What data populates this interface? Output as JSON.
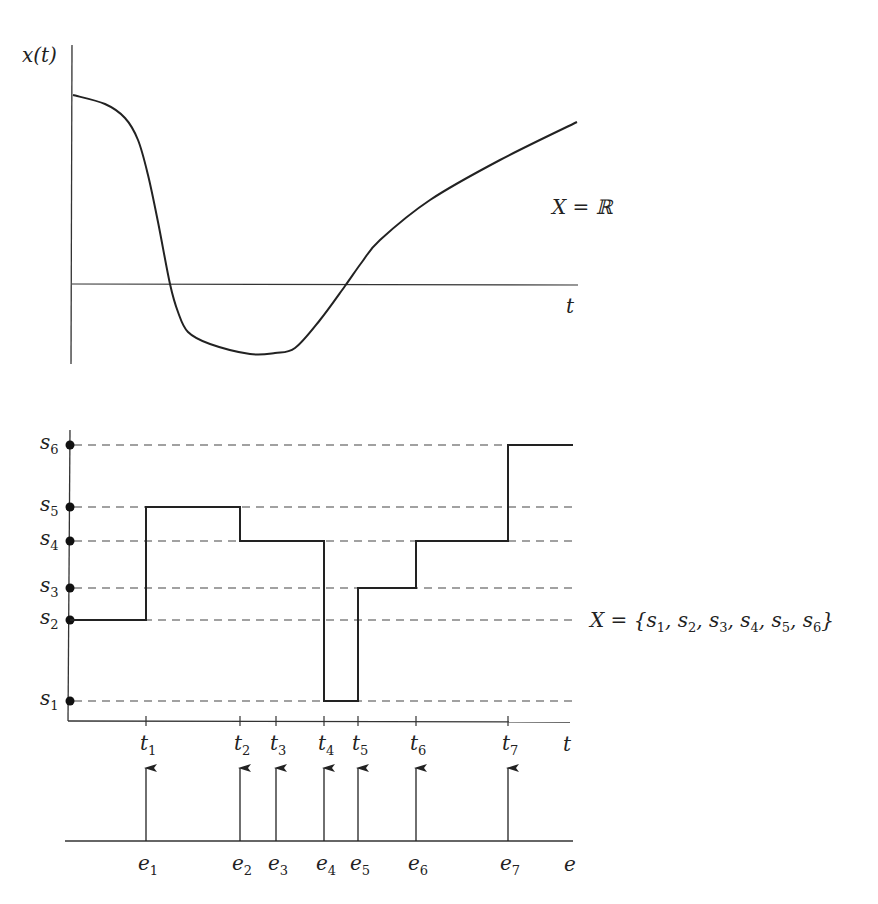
{
  "top_plot": {
    "y_axis_label": "x(t)",
    "x_axis_label": "t",
    "state_space_label": "X = ℝ",
    "curve_points": [
      [
        73,
        95
      ],
      [
        105,
        104
      ],
      [
        125,
        118
      ],
      [
        138,
        140
      ],
      [
        148,
        175
      ],
      [
        158,
        222
      ],
      [
        170,
        284
      ],
      [
        178,
        312
      ],
      [
        188,
        332
      ],
      [
        210,
        344
      ],
      [
        250,
        354
      ],
      [
        275,
        353
      ],
      [
        295,
        348
      ],
      [
        320,
        320
      ],
      [
        345,
        286
      ],
      [
        362,
        262
      ],
      [
        380,
        240
      ],
      [
        430,
        200
      ],
      [
        500,
        160
      ],
      [
        577,
        122
      ]
    ]
  },
  "bottom_plot": {
    "x_axis_label": "t",
    "state_space_label": "X = {s1, s2, s3, s4, s5, s6}",
    "states": [
      {
        "name": "s",
        "sub": "1",
        "y": 701
      },
      {
        "name": "s",
        "sub": "2",
        "y": 620
      },
      {
        "name": "s",
        "sub": "3",
        "y": 588
      },
      {
        "name": "s",
        "sub": "4",
        "y": 541
      },
      {
        "name": "s",
        "sub": "5",
        "y": 507
      },
      {
        "name": "s",
        "sub": "6",
        "y": 445
      }
    ],
    "times": [
      {
        "name": "t",
        "sub": "1",
        "x": 146
      },
      {
        "name": "t",
        "sub": "2",
        "x": 240
      },
      {
        "name": "t",
        "sub": "3",
        "x": 276
      },
      {
        "name": "t",
        "sub": "4",
        "x": 324
      },
      {
        "name": "t",
        "sub": "5",
        "x": 358
      },
      {
        "name": "t",
        "sub": "6",
        "x": 416
      },
      {
        "name": "t",
        "sub": "7",
        "x": 508
      }
    ],
    "trajectory_sequence": [
      "s2",
      "s5",
      "s4",
      "s4",
      "s1",
      "s3",
      "s4",
      "s6"
    ]
  },
  "event_line": {
    "axis_label": "e",
    "events": [
      {
        "name": "e",
        "sub": "1"
      },
      {
        "name": "e",
        "sub": "2"
      },
      {
        "name": "e",
        "sub": "3"
      },
      {
        "name": "e",
        "sub": "4"
      },
      {
        "name": "e",
        "sub": "5"
      },
      {
        "name": "e",
        "sub": "6"
      },
      {
        "name": "e",
        "sub": "7"
      }
    ]
  },
  "chart_data": {
    "type": "line",
    "title": "",
    "panels": [
      {
        "name": "continuous-state",
        "xlabel": "t",
        "ylabel": "x(t)",
        "state_space": "X = ℝ"
      },
      {
        "name": "discrete-event",
        "xlabel": "t",
        "state_space": "X = {s1, s2, s3, s4, s5, s6}",
        "categories": [
          "0",
          "t1",
          "t2",
          "t3",
          "t4",
          "t5",
          "t6",
          "t7"
        ],
        "series": [
          {
            "name": "state",
            "values": [
              "s2",
              "s5",
              "s4",
              "s4",
              "s1",
              "s3",
              "s4",
              "s6"
            ]
          }
        ]
      },
      {
        "name": "event-sequence",
        "xlabel": "e",
        "events": [
          "e1",
          "e2",
          "e3",
          "e4",
          "e5",
          "e6",
          "e7"
        ]
      }
    ]
  }
}
